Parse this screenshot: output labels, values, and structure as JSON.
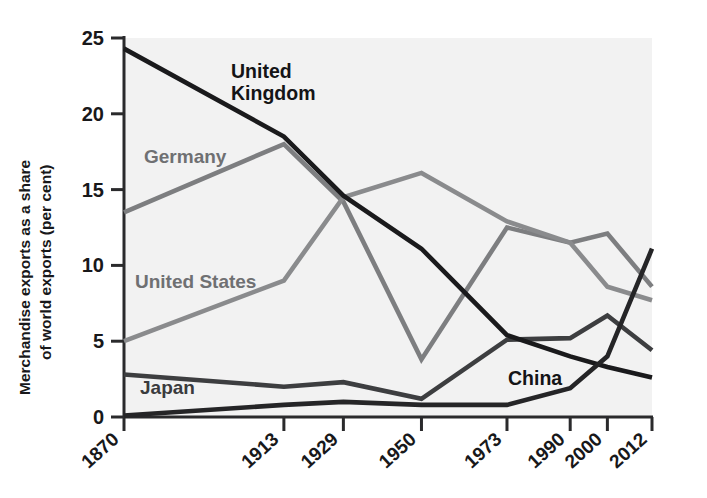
{
  "chart_data": {
    "type": "line",
    "title": "",
    "subtitle": "",
    "xlabel": "",
    "ylabel": "Merchandise exports as a share of world exports (per cent)",
    "ylabel_line1": "Merchandise exports as a share",
    "ylabel_line2": "of world exports (per cent)",
    "categories": [
      "1870",
      "1913",
      "1929",
      "1950",
      "1973",
      "1990",
      "2000",
      "2012"
    ],
    "x": [
      1870,
      1913,
      1929,
      1950,
      1973,
      1990,
      2000,
      2012
    ],
    "ylim": [
      0,
      25
    ],
    "xlim": [
      1870,
      2012
    ],
    "yticks": [
      0,
      5,
      10,
      15,
      20,
      25
    ],
    "ytick_labels": [
      "0",
      "5",
      "10",
      "15",
      "20",
      "25"
    ],
    "grid": false,
    "legend": "inline-annotations",
    "legend_position": "inline",
    "series": [
      {
        "name": "United Kingdom",
        "color": "#1a1a1c",
        "width": 4.6,
        "values": [
          24.3,
          18.5,
          14.6,
          11.1,
          5.4,
          4.0,
          3.3,
          2.6
        ],
        "label": {
          "text_line1": "United",
          "text_line2": "Kingdom",
          "style": "dark"
        }
      },
      {
        "name": "Germany",
        "color": "#7d7e80",
        "width": 4.6,
        "values": [
          13.5,
          18.0,
          14.2,
          3.8,
          12.5,
          11.5,
          12.1,
          8.6
        ],
        "label": {
          "text_line1": "Germany",
          "text_line2": "",
          "style": "mid"
        }
      },
      {
        "name": "United States",
        "color": "#8a8b8d",
        "width": 4.6,
        "values": [
          5.0,
          9.0,
          14.5,
          16.1,
          12.9,
          11.5,
          8.6,
          7.7
        ],
        "label": {
          "text_line1": "United States",
          "text_line2": "",
          "style": "mid"
        }
      },
      {
        "name": "Japan",
        "color": "#3d3e40",
        "width": 4.6,
        "values": [
          2.8,
          2.0,
          2.3,
          1.2,
          5.1,
          5.2,
          6.7,
          4.4
        ],
        "label": {
          "text_line1": "Japan",
          "text_line2": "",
          "style": "near"
        }
      },
      {
        "name": "China",
        "color": "#252527",
        "width": 4.6,
        "values": [
          0.1,
          0.8,
          1.0,
          0.8,
          0.8,
          1.9,
          4.0,
          11.1
        ],
        "label": {
          "text_line1": "China",
          "text_line2": "",
          "style": "dark"
        }
      }
    ]
  },
  "annotations": {
    "united_kingdom": {
      "line1": "United",
      "line2": "Kingdom"
    },
    "germany": {
      "line1": "Germany"
    },
    "united_states": {
      "line1": "United States"
    },
    "japan": {
      "line1": "Japan"
    },
    "china": {
      "line1": "China"
    }
  },
  "axis": {
    "y_ticks": [
      "25",
      "20",
      "15",
      "10",
      "5",
      "0"
    ],
    "x_ticks": [
      "1870",
      "1913",
      "1929",
      "1950",
      "1973",
      "1990",
      "2000",
      "2012"
    ]
  },
  "colors": {
    "plot_background": "#f2f2f2",
    "page_background": "#ffffff",
    "axis": "#2a2a2c",
    "uk": "#1a1a1c",
    "germany": "#7d7e80",
    "united_states": "#8a8b8d",
    "japan": "#3d3e40",
    "china": "#252527"
  }
}
